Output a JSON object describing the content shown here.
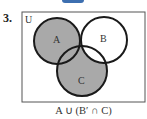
{
  "problem": {
    "number": "3."
  },
  "diagram": {
    "universe_label": "U",
    "sets": [
      {
        "label": "A",
        "cx": 57,
        "cy": 41,
        "r": 23
      },
      {
        "label": "B",
        "cx": 104,
        "cy": 40,
        "r": 23
      },
      {
        "label": "C",
        "cx": 82,
        "cy": 71,
        "r": 25
      }
    ],
    "shaded_expression": "A ∪ (B′ ∩ C)",
    "shade_color": "#a9a9a9",
    "outline_color": "#1a1a1a"
  }
}
